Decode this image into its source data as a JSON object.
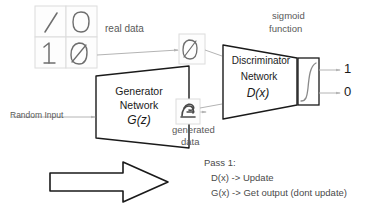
{
  "diagram": {
    "title_text_absent": true,
    "labels": {
      "real_data": "real data",
      "sigmoid_function_line1": "sigmoid",
      "sigmoid_function_line2": "function",
      "random_input": "Random Input",
      "generated_data_line1": "generated",
      "generated_data_line2": "data",
      "output_one": "1",
      "output_zero": "0"
    },
    "generator_block": {
      "line1": "Generator",
      "line2": "Network",
      "line3": "G(z)"
    },
    "discriminator_block": {
      "line1": "Discriminator",
      "line2": "Network",
      "line3": "D(x)"
    },
    "notes": {
      "line1": "Pass 1:",
      "line2": "D(x) -> Update",
      "line3": "G(x) -> Get output (dont update)"
    },
    "real_data_samples": [
      {
        "value": "1",
        "style": "slash"
      },
      {
        "value": "0",
        "style": "oval"
      },
      {
        "value": "1",
        "style": "serif-one"
      },
      {
        "value": "0",
        "style": "slashed-zero"
      }
    ],
    "discriminator_input_sample": {
      "value": "0",
      "style": "slashed-zero"
    },
    "generated_sample": {
      "value": "noise",
      "style": "scribble"
    },
    "colors": {
      "stroke_dark": "#1a1a1a",
      "stroke_light": "#b4b4b4",
      "text_gray": "#595959",
      "digit_ink": "#6e6e6e",
      "cell_border": "#dcdcdc",
      "background": "#ffffff"
    }
  }
}
